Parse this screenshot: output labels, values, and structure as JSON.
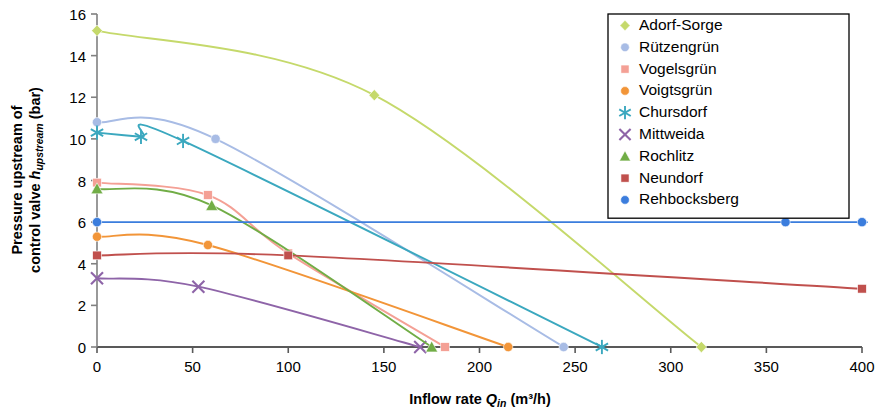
{
  "chart_data": {
    "type": "line",
    "title": "",
    "xlabel": "Inflow rate Q_in (m³/h)",
    "ylabel": "Pressure upstream of control valve h_upstream (bar)",
    "xlim": [
      0,
      400
    ],
    "ylim": [
      0,
      16
    ],
    "xticks": [
      0,
      50,
      100,
      150,
      200,
      250,
      300,
      350,
      400
    ],
    "yticks": [
      0,
      2,
      4,
      6,
      8,
      10,
      12,
      14,
      16
    ],
    "grid": false,
    "legend_position": "top-right",
    "series": [
      {
        "name": "Adorf-Sorge",
        "color": "#c5d96b",
        "marker": "diamond",
        "points": [
          [
            0,
            15.2
          ],
          [
            145,
            12.1
          ],
          [
            316,
            0.0
          ]
        ]
      },
      {
        "name": "Rützengrün",
        "color": "#a8bce5",
        "marker": "circle",
        "points": [
          [
            0,
            10.8
          ],
          [
            62,
            10.0
          ],
          [
            244,
            0.0
          ]
        ]
      },
      {
        "name": "Vogelsgrün",
        "color": "#f4a095",
        "marker": "square",
        "points": [
          [
            0,
            7.9
          ],
          [
            58,
            7.3
          ],
          [
            100,
            4.5
          ],
          [
            182,
            0.0
          ]
        ]
      },
      {
        "name": "Voigtsgrün",
        "color": "#f29538",
        "marker": "circle",
        "points": [
          [
            0,
            5.3
          ],
          [
            58,
            4.9
          ],
          [
            215,
            0.0
          ]
        ]
      },
      {
        "name": "Chursdorf",
        "color": "#3ba8bf",
        "marker": "asterisk",
        "points": [
          [
            0,
            10.3
          ],
          [
            23,
            10.1
          ],
          [
            45,
            9.9
          ],
          [
            264,
            0.0
          ]
        ]
      },
      {
        "name": "Mittweida",
        "color": "#8e64a8",
        "marker": "cross",
        "points": [
          [
            0,
            3.3
          ],
          [
            53,
            2.9
          ],
          [
            169,
            0.0
          ]
        ]
      },
      {
        "name": "Rochlitz",
        "color": "#71ad46",
        "marker": "triangle",
        "points": [
          [
            0,
            7.6
          ],
          [
            60,
            6.8
          ],
          [
            175,
            0.0
          ]
        ]
      },
      {
        "name": "Neundorf",
        "color": "#c0504d",
        "marker": "square",
        "points": [
          [
            0,
            4.4
          ],
          [
            100,
            4.4
          ],
          [
            400,
            2.8
          ]
        ]
      },
      {
        "name": "Rehbocksberg",
        "color": "#3b7ddd",
        "marker": "circle",
        "points": [
          [
            0,
            6.0
          ],
          [
            360,
            6.0
          ],
          [
            400,
            6.0
          ]
        ]
      }
    ]
  },
  "axes": {
    "y_label_line1": "Pressure upstream of",
    "y_label_line2_a": "control valve ",
    "y_label_line2_h": "h",
    "y_label_line2_sub": "upstream",
    "y_label_line2_b": " (bar)",
    "x_label_a": "Inflow rate ",
    "x_label_q": "Q",
    "x_label_sub": "in",
    "x_label_b": " (m³/h)"
  }
}
